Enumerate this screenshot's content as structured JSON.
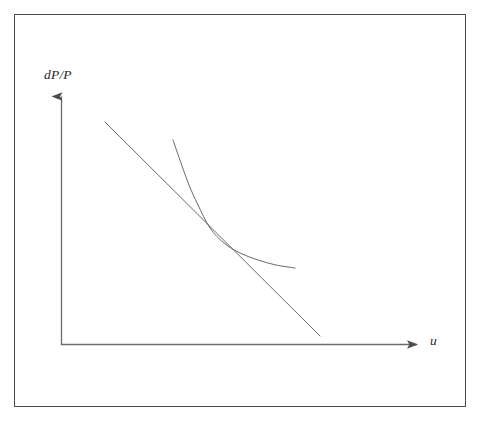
{
  "figure": {
    "kind": "economics-diagram",
    "name": "Phillips curve with tangent line",
    "background_color": "#ffffff",
    "frame": {
      "name": "figure-border",
      "color": "#4a4a4a",
      "x": 14,
      "y": 14,
      "width": 452,
      "height": 393
    }
  },
  "chart_data": {
    "type": "line",
    "title": "",
    "subtitle": "",
    "xlabel": "u",
    "ylabel": "dP/P",
    "grid": false,
    "legend": null,
    "legend_position": "none",
    "axes": {
      "origin": {
        "x": 61,
        "y": 345
      },
      "x_axis": {
        "name": "unemployment-axis",
        "label": "u",
        "label_style": "italic",
        "from": {
          "x": 61,
          "y": 345
        },
        "to": {
          "x": 420,
          "y": 345
        },
        "arrow": true,
        "ticks": [],
        "tick_labels": []
      },
      "y_axis": {
        "name": "inflation-axis",
        "label": "dP/P",
        "label_style": "italic",
        "from": {
          "x": 61,
          "y": 345
        },
        "to": {
          "x": 61,
          "y": 94
        },
        "arrow": true,
        "ticks": [],
        "tick_labels": []
      },
      "xlim": [
        61,
        420
      ],
      "ylim": [
        345,
        94
      ]
    },
    "series": [
      {
        "name": "tangent-line",
        "label": "",
        "kind": "straight-line",
        "color": "#58585a",
        "width": 0.9,
        "points": [
          {
            "x": 105,
            "y": 122
          },
          {
            "x": 320,
            "y": 336
          }
        ]
      },
      {
        "name": "phillips-curve",
        "label": "",
        "kind": "convex-curve",
        "color": "#58585a",
        "width": 0.9,
        "points": [
          {
            "x": 173,
            "y": 140
          },
          {
            "x": 181,
            "y": 163
          },
          {
            "x": 189,
            "y": 185
          },
          {
            "x": 198,
            "y": 205
          },
          {
            "x": 210,
            "y": 228
          },
          {
            "x": 224,
            "y": 243
          },
          {
            "x": 240,
            "y": 253
          },
          {
            "x": 258,
            "y": 260
          },
          {
            "x": 276,
            "y": 265
          },
          {
            "x": 295,
            "y": 268
          }
        ]
      }
    ],
    "annotations": [
      {
        "name": "tangency-point",
        "text": "",
        "x": 210,
        "y": 228,
        "visible": false
      }
    ]
  },
  "labels": {
    "y_axis_label": "dP/P",
    "x_axis_label": "u"
  }
}
